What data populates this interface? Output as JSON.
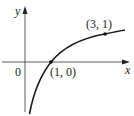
{
  "diagram": {
    "type": "function-graph",
    "axes": {
      "x_label": "x",
      "y_label": "y",
      "origin_label": "0"
    },
    "curve": {
      "description": "logarithmic curve y = log base 3 of x",
      "color": "#1a1a1a"
    },
    "points": [
      {
        "label": "(1, 0)",
        "x": 1,
        "y": 0
      },
      {
        "label": "(3, 1)",
        "x": 3,
        "y": 1
      }
    ]
  }
}
